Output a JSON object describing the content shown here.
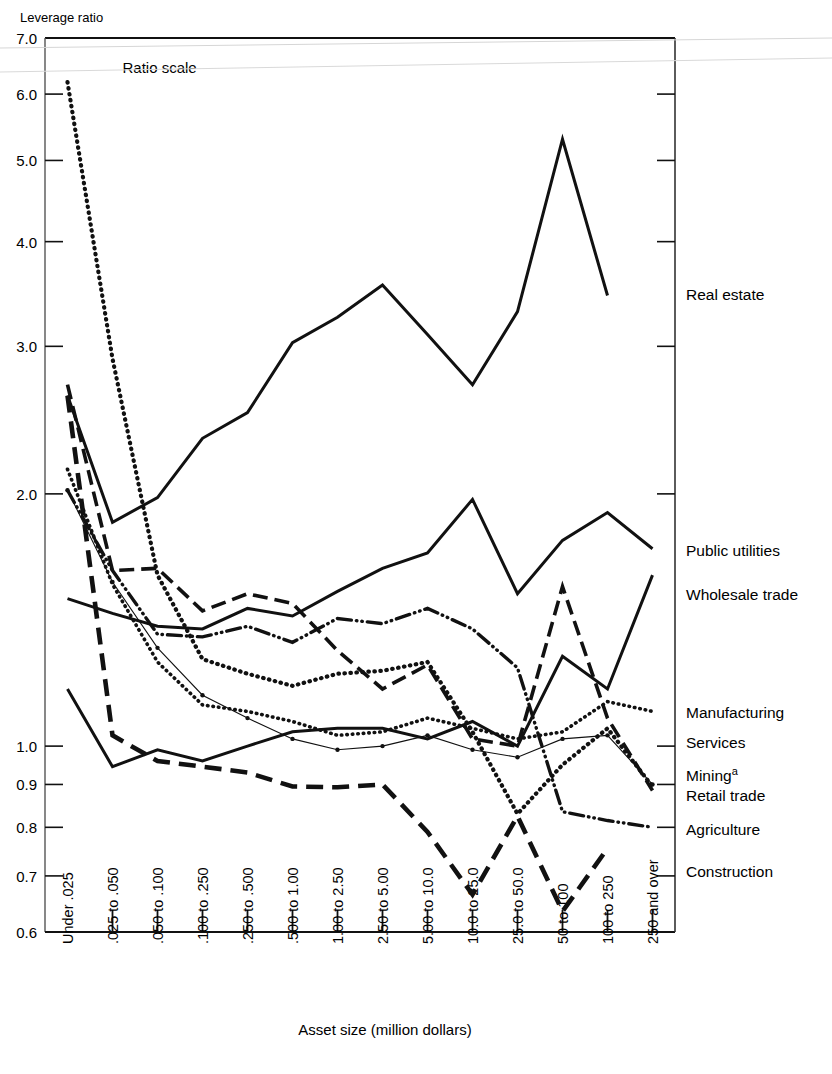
{
  "figure": {
    "y_axis_title": "Leverage ratio",
    "x_axis_title": "Asset size (million dollars)",
    "scale_note": "Ratio scale",
    "mining_footnote_marker": "a"
  },
  "chart_data": {
    "type": "line",
    "title": "Leverage ratio",
    "xlabel": "Asset size (million dollars)",
    "ylabel": "Leverage ratio",
    "yscale": "log",
    "ylim": [
      0.6,
      7.0
    ],
    "grid": false,
    "legend_position": "right-inline",
    "ytick_labels": [
      "7.0",
      "6.0",
      "5.0",
      "4.0",
      "3.0",
      "2.0",
      "1.0",
      "0.9",
      "0.8",
      "0.7",
      "0.6"
    ],
    "yticks": [
      7.0,
      6.0,
      5.0,
      4.0,
      3.0,
      2.0,
      1.0,
      0.9,
      0.8,
      0.7,
      0.6
    ],
    "categories": [
      "Under .025",
      ".025 to .050",
      ".050 to .100",
      ".100 to .250",
      ".250 to .500",
      ".500 to 1.00",
      "1.00 to 2.50",
      "2.50 to 5.00",
      "5.00 to 10.0",
      "10.0 to 25.0",
      "25.0 to 50.0",
      "50 to 100",
      "100 to 250",
      "250 and over"
    ],
    "series": [
      {
        "name": "Real estate",
        "style": "solid-thick",
        "values": [
          2.62,
          1.85,
          1.98,
          2.33,
          2.5,
          3.03,
          3.25,
          3.55,
          3.1,
          2.7,
          3.3,
          5.3,
          3.45,
          null
        ]
      },
      {
        "name": "Public utilities",
        "style": "solid-thick",
        "values": [
          1.5,
          1.44,
          1.39,
          1.38,
          1.46,
          1.43,
          1.53,
          1.63,
          1.7,
          1.97,
          1.52,
          1.76,
          1.9,
          1.72
        ]
      },
      {
        "name": "Wholesale trade",
        "style": "solid-thick",
        "values": [
          1.17,
          0.945,
          0.99,
          0.96,
          1.0,
          1.04,
          1.05,
          1.05,
          1.02,
          1.07,
          1.0,
          1.28,
          1.17,
          1.6
        ]
      },
      {
        "name": "Manufacturing",
        "style": "dotted",
        "values": [
          2.14,
          1.56,
          1.26,
          1.12,
          1.1,
          1.07,
          1.03,
          1.04,
          1.08,
          1.05,
          1.02,
          1.04,
          1.13,
          1.1
        ]
      },
      {
        "name": "Services",
        "style": "thin-marker",
        "values": [
          2.02,
          1.57,
          1.31,
          1.15,
          1.08,
          1.02,
          0.99,
          1.0,
          1.03,
          0.99,
          0.97,
          1.02,
          1.03,
          0.9
        ]
      },
      {
        "name": "Mining",
        "style": "dotted-heavy",
        "values": [
          6.2,
          2.9,
          1.6,
          1.27,
          1.22,
          1.18,
          1.22,
          1.23,
          1.26,
          1.04,
          0.83,
          0.95,
          1.05,
          0.895
        ]
      },
      {
        "name": "Retail trade",
        "style": "dashed-long",
        "values": [
          2.7,
          1.62,
          1.63,
          1.45,
          1.52,
          1.48,
          1.3,
          1.17,
          1.25,
          1.02,
          1.0,
          1.55,
          1.08,
          0.885
        ]
      },
      {
        "name": "Agriculture",
        "style": "dash-dot-dot",
        "values": [
          2.02,
          1.62,
          1.36,
          1.35,
          1.39,
          1.33,
          1.42,
          1.4,
          1.46,
          1.38,
          1.24,
          0.835,
          0.815,
          0.8
        ]
      },
      {
        "name": "Construction",
        "style": "dashed-thick",
        "values": [
          2.62,
          1.03,
          0.96,
          0.945,
          0.93,
          0.895,
          0.893,
          0.9,
          0.79,
          0.665,
          0.825,
          0.635,
          0.755,
          null
        ]
      }
    ],
    "annotations": [
      {
        "text": "Ratio scale",
        "x_category": ".025 to .050",
        "y": 6.35
      }
    ]
  },
  "series_labels": [
    {
      "text": "Real estate"
    },
    {
      "text": "Public utilities"
    },
    {
      "text": "Wholesale trade"
    },
    {
      "text": "Manufacturing"
    },
    {
      "text": "Services"
    },
    {
      "text": "Mining"
    },
    {
      "text": "Retail trade"
    },
    {
      "text": "Agriculture"
    },
    {
      "text": "Construction"
    }
  ]
}
